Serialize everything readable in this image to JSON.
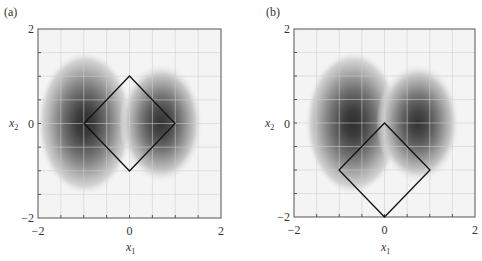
{
  "chart_data": [
    {
      "type": "heatmap",
      "panel_label": "(a)",
      "title": "",
      "xlabel": "x1",
      "ylabel": "x2",
      "xlim": [
        -2,
        2
      ],
      "ylim": [
        -2,
        2
      ],
      "x_ticks": [
        "-2",
        "0",
        "2"
      ],
      "y_ticks": [
        "-2",
        "0",
        "2"
      ],
      "grid": true,
      "grid_step": 0.5,
      "contours": {
        "description": "Filled grayscale contours of a two-lobed density",
        "lobes": [
          {
            "center": [
              -0.7,
              0.0
            ],
            "sigma_x": 0.55,
            "sigma_y": 0.75,
            "peak": 1.0
          },
          {
            "center": [
              0.7,
              0.0
            ],
            "sigma_x": 0.45,
            "sigma_y": 0.6,
            "peak": 0.9
          }
        ]
      },
      "constraint_region": {
        "shape": "diamond",
        "vertices": [
          [
            0,
            1
          ],
          [
            1,
            0
          ],
          [
            0,
            -1
          ],
          [
            -1,
            0
          ]
        ]
      }
    },
    {
      "type": "heatmap",
      "panel_label": "(b)",
      "title": "",
      "xlabel": "x1",
      "ylabel": "x2",
      "xlim": [
        -2,
        2
      ],
      "ylim": [
        -2,
        2
      ],
      "x_ticks": [
        "-2",
        "0",
        "2"
      ],
      "y_ticks": [
        "-2",
        "0",
        "2"
      ],
      "grid": true,
      "grid_step": 0.5,
      "contours": {
        "description": "Filled grayscale contours of a two-lobed density",
        "lobes": [
          {
            "center": [
              -0.7,
              0.0
            ],
            "sigma_x": 0.55,
            "sigma_y": 0.75,
            "peak": 1.0
          },
          {
            "center": [
              0.7,
              0.0
            ],
            "sigma_x": 0.45,
            "sigma_y": 0.6,
            "peak": 0.9
          }
        ]
      },
      "constraint_region": {
        "shape": "diamond",
        "vertices": [
          [
            0,
            0
          ],
          [
            1,
            -1
          ],
          [
            0,
            -2
          ],
          [
            -1,
            -1
          ]
        ]
      }
    }
  ],
  "panels": [
    {
      "label": "(a)",
      "xlabel_main": "x",
      "xlabel_sub": "1",
      "ylabel_main": "x",
      "ylabel_sub": "2",
      "tick_neg": "−2",
      "tick_zero": "0",
      "tick_pos": "2"
    },
    {
      "label": "(b)",
      "xlabel_main": "x",
      "xlabel_sub": "1",
      "ylabel_main": "x",
      "ylabel_sub": "2",
      "tick_neg": "−2",
      "tick_zero": "0",
      "tick_pos": "2"
    }
  ],
  "colors": {
    "line": "#111111",
    "grid": "#cfcfcf",
    "frame": "#555555",
    "background": "#f4f4f4"
  }
}
